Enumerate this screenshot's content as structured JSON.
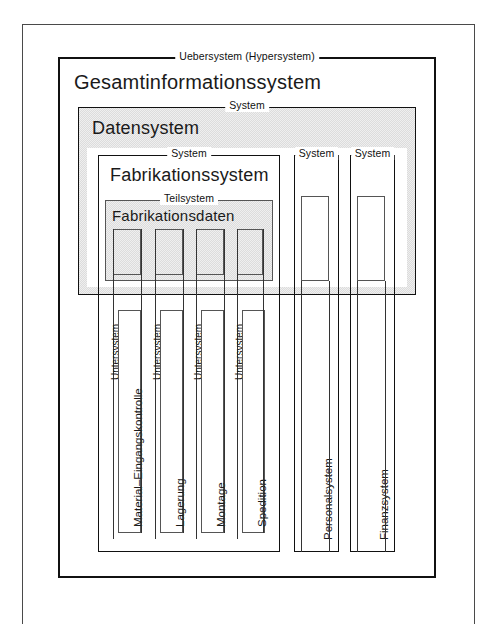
{
  "diagram": {
    "title_alt": "Systemhierarchie eines Gesamtinformationssystems",
    "outer_frame_name": "page-border",
    "levels": {
      "hypersystem_caption": "Uebersystem (Hypersystem)",
      "hypersystem_label": "Gesamtinformationssystem",
      "system_caption": "System",
      "teilsystem_caption": "Teilsystem",
      "untersystem_caption": "Untersystem"
    },
    "datensystem": {
      "caption": "System",
      "label": "Datensystem"
    },
    "fabrikationssystem": {
      "caption": "System",
      "label": "Fabrikationssystem"
    },
    "fabrikationsdaten": {
      "caption": "Teilsystem",
      "label": "Fabrikationsdaten"
    },
    "peer_systems": [
      {
        "caption": "System",
        "label": "Personalsystem"
      },
      {
        "caption": "System",
        "label": "Finanzsystem"
      }
    ],
    "untersysteme": [
      {
        "caption": "Untersystem",
        "label": "Material–Eingangskontrolle"
      },
      {
        "caption": "Untersystem",
        "label": "Lagerung"
      },
      {
        "caption": "Untersystem",
        "label": "Montage"
      },
      {
        "caption": "Untersystem",
        "label": "Spedition"
      }
    ],
    "colors": {
      "ink": "#111111",
      "hairline": "#555555",
      "gray_fill": "#dcdcdc",
      "page": "#ffffff"
    }
  }
}
